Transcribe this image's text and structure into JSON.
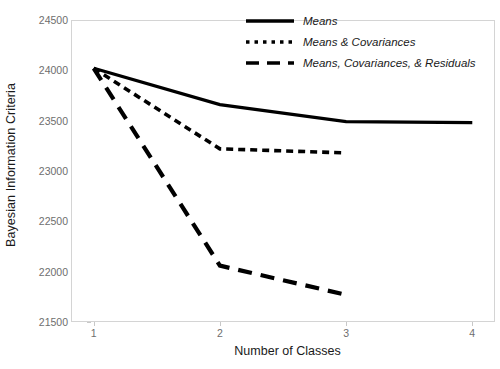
{
  "chart_data": {
    "type": "line",
    "title": "",
    "xlabel": "Number of Classes",
    "ylabel": "Bayesian Information Criteria",
    "x": [
      1,
      2,
      3,
      4
    ],
    "xlim": [
      0.82,
      4.18
    ],
    "ylim": [
      21500,
      24500
    ],
    "xticks": [
      "1",
      "2",
      "3",
      "4"
    ],
    "yticks": [
      "21500",
      "22000",
      "22500",
      "23000",
      "23500",
      "24000",
      "24500"
    ],
    "ytick_values": [
      21500,
      22000,
      22500,
      23000,
      23500,
      24000,
      24500
    ],
    "grid": false,
    "legend_position": "top-right",
    "line_color": "#000000",
    "series": [
      {
        "name": "Means",
        "style": "solid",
        "x": [
          1,
          2,
          3,
          4
        ],
        "values": [
          24020,
          23660,
          23490,
          23480
        ]
      },
      {
        "name": "Means & Covariances",
        "style": "dotted",
        "x": [
          1,
          2,
          3
        ],
        "values": [
          24020,
          23220,
          23180
        ]
      },
      {
        "name": "Means, Covariances, & Residuals",
        "style": "dashed",
        "x": [
          1,
          2,
          3
        ],
        "values": [
          24020,
          22060,
          21770
        ]
      }
    ]
  },
  "legend": {
    "items": [
      {
        "label": "Means"
      },
      {
        "label": "Means & Covariances"
      },
      {
        "label": "Means, Covariances, & Residuals"
      }
    ]
  }
}
